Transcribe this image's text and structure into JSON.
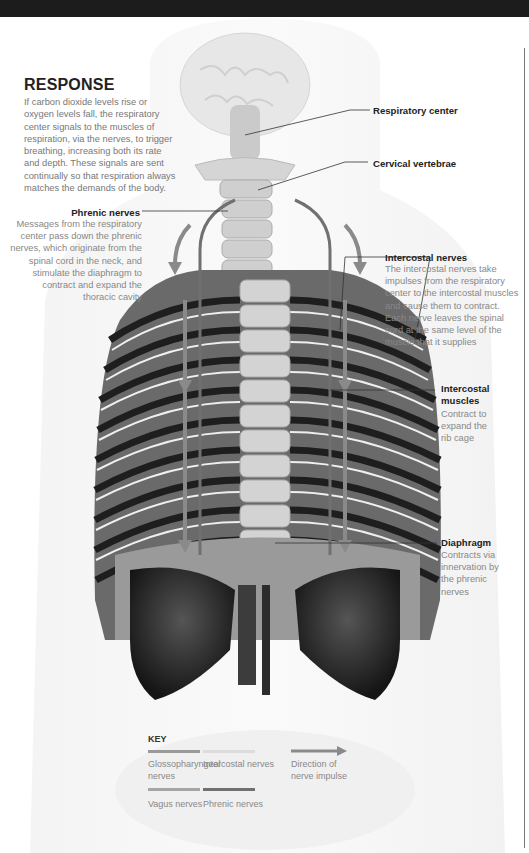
{
  "title": "RESPONSE",
  "intro": "If carbon dioxide levels rise or oxygen levels fall, the respiratory center signals to the muscles of respiration, via the nerves, to trigger breathing, increasing both its rate and depth. These signals are sent continually so that respiration always matches the demands of the body.",
  "labels": {
    "respiratory_center": {
      "title": "Respiratory center"
    },
    "cervical_vertebrae": {
      "title": "Cervical vertebrae"
    },
    "phrenic_nerves": {
      "title": "Phrenic nerves",
      "text": "Messages from the respiratory center pass down the phrenic nerves, which originate from the spinal cord in the neck, and stimulate the diaphragm to contract and expand the thoracic cavity"
    },
    "intercostal_nerves": {
      "title": "Intercostal nerves",
      "text": "The intercostal nerves take impulses from the respiratory center to the intercostal muscles and cause them to contract. Each nerve leaves the spinal cord at the same level of the muscle that it supplies"
    },
    "intercostal_muscles": {
      "title": "Intercostal muscles",
      "text": "Contract to expand the rib cage"
    },
    "diaphragm": {
      "title": "Diaphragm",
      "text": "Contracts via innervation by the phrenic nerves"
    }
  },
  "key": {
    "title": "KEY",
    "items": [
      {
        "label": "Glossopharyngeal nerves",
        "color": "#9a9a9a"
      },
      {
        "label": "Intercostal nerves",
        "color": "#dcdcdc"
      },
      {
        "label": "Direction of nerve impulse",
        "color": "#8a8a8a"
      },
      {
        "label": "Vagus nerves",
        "color": "#a5a5a5"
      },
      {
        "label": "Phrenic nerves",
        "color": "#707070"
      }
    ]
  },
  "colors": {
    "topbar": "#1c1c1c",
    "heading": "#222222",
    "body_text": "#777777",
    "phrenic": "#707070",
    "arrow": "#8a8a8a"
  }
}
